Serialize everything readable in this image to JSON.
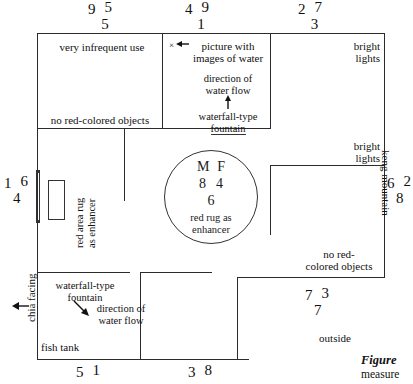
{
  "figure": {
    "type": "floor-plan-diagram",
    "caption_lead": "Figure",
    "caption_rest": "measure"
  },
  "edge_numbers": {
    "top": [
      {
        "a": "9",
        "b": "5",
        "c": "5"
      },
      {
        "a": "4",
        "b": "9",
        "c": "1"
      },
      {
        "a": "2",
        "b": "7",
        "c": "3"
      }
    ],
    "left": [
      {
        "a": "1",
        "b": "6",
        "c": "4"
      }
    ],
    "right": [
      {
        "a": "6",
        "b": "2",
        "c": "8"
      }
    ],
    "bottom": [
      {
        "a": "5",
        "b": "1",
        "c": ""
      },
      {
        "a": "3",
        "b": "8",
        "c": ""
      },
      {
        "a": "7",
        "b": "3",
        "c": "7"
      }
    ]
  },
  "circle": {
    "row1_left": "M",
    "row1_right": "F",
    "row2_left": "8",
    "row2_right": "4",
    "row3": "6",
    "caption_line1": "red rug as",
    "caption_line2": "enhancer"
  },
  "rooms": {
    "top_left_label": "very infrequent use",
    "top_left_lower_label": "no red-colored objects",
    "top_center_picture": "picture with",
    "top_center_picture2": "images of water",
    "top_center_flow1": "direction of",
    "top_center_flow2": "water flow",
    "top_center_fountain1": "waterfall-type",
    "top_center_fountain2": "fountain",
    "top_right_lights1": "bright",
    "top_right_lights2": "lights",
    "mid_right_lights1": "bright",
    "mid_right_lights2": "lights",
    "mid_right_nored1": "no red-",
    "mid_right_nored2": "colored objects",
    "bottom_left_fountain1": "waterfall-type",
    "bottom_left_fountain2": "fountain",
    "bottom_left_flow1": "direction of",
    "bottom_left_flow2": "water flow",
    "bottom_left_tank": "fish tank",
    "bottom_right_outside": "outside"
  },
  "vertical_labels": {
    "left_facing": "chia facing",
    "right_mountain": "keng mountain",
    "rug_line1": "red area rug",
    "rug_line2": "as enhancer"
  },
  "markers": {
    "x_symbol": "×"
  },
  "colors": {
    "wall": "#2b2b2b",
    "text": "#111111",
    "background": "#ffffff"
  }
}
